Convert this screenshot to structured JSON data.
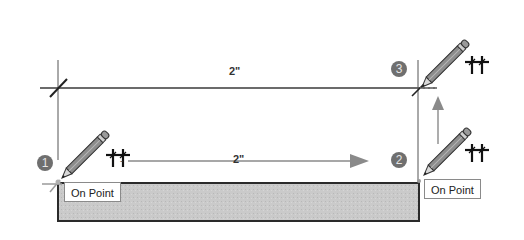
{
  "diagram": {
    "top_dimension_label": "2\"",
    "middle_dimension_label": "2\"",
    "steps": [
      {
        "number": "1",
        "tooltip": "On Point"
      },
      {
        "number": "2",
        "tooltip": "On Point"
      },
      {
        "number": "3",
        "tooltip": ""
      }
    ],
    "colors": {
      "badge": "#6f6f6f",
      "line": "#3a3a3a",
      "arrow": "#8a8a8a",
      "rect_fill": "#c8c8c8",
      "rect_border": "#2a2a2a"
    },
    "icons": [
      "pencil-cursor-icon",
      "inference-crosshair-icon",
      "arrow-right-icon",
      "arrow-up-icon"
    ]
  }
}
